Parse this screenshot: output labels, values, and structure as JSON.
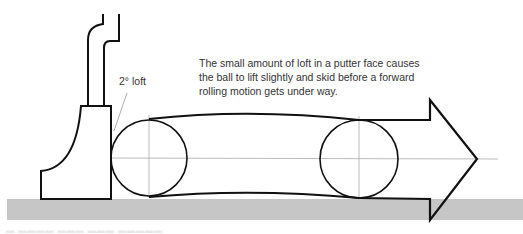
{
  "diagram": {
    "loft_label": "2° loft",
    "caption_lines": [
      "The small amount of loft in a putter face causes",
      "the ball to lift slightly and skid before a forward",
      "rolling motion gets under way."
    ],
    "colors": {
      "stroke": "#111111",
      "guide": "#999999",
      "ground": "#c6c6c6",
      "text": "#333333"
    },
    "elements": {
      "putter": "putter-head-and-shaft",
      "ball_start": {
        "cx": 149,
        "cy": 158,
        "r": 38
      },
      "ball_end": {
        "cx": 359,
        "cy": 159,
        "r": 39
      },
      "arrow": "forward-motion-arrow",
      "ground": "green-surface"
    }
  }
}
